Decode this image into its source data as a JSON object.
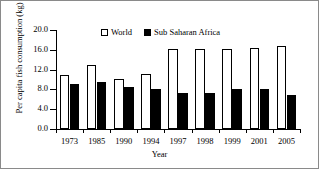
{
  "chart_data": {
    "type": "bar",
    "title": "",
    "xlabel": "Year",
    "ylabel": "Per capita fish consumption (kg)",
    "categories": [
      "1973",
      "1985",
      "1990",
      "1994",
      "1997",
      "1998",
      "1999",
      "2001",
      "2005"
    ],
    "series": [
      {
        "name": "World",
        "style": "open-white-bar",
        "color": "#ffffff",
        "edge_color": "#000000",
        "values": [
          11.0,
          12.9,
          10.2,
          11.1,
          16.1,
          16.1,
          16.1,
          16.4,
          16.8
        ]
      },
      {
        "name": "Sub Saharan Africa",
        "style": "solid-black-bar",
        "color": "#000000",
        "edge_color": "#000000",
        "values": [
          9.0,
          9.4,
          8.5,
          8.1,
          7.2,
          7.2,
          8.1,
          8.0,
          6.8
        ]
      }
    ],
    "ylim": [
      0.0,
      20.0
    ],
    "ytick_labels": [
      "0.0",
      "4.0",
      "8.0",
      "12.0",
      "16.0",
      "20.0"
    ],
    "ytick_values": [
      0.0,
      4.0,
      8.0,
      12.0,
      16.0,
      20.0
    ],
    "grid": false,
    "legend_position": "top-center",
    "frame": "box-border"
  },
  "legend": {
    "items": [
      {
        "label": "World",
        "swatch": "open-square-icon"
      },
      {
        "label": "Sub Saharan Africa",
        "swatch": "filled-square-icon"
      }
    ]
  }
}
